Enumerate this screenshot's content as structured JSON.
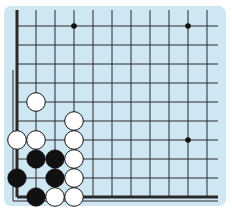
{
  "board": {
    "background": "#cfe6f3",
    "line_color": "#2a2a2a",
    "origin_x": 17,
    "origin_y": 197,
    "spacing": 19,
    "cols": 11,
    "rows": 10,
    "edges": [
      "left",
      "bottom"
    ],
    "star_points": [
      [
        3,
        9
      ],
      [
        9,
        9
      ],
      [
        9,
        3
      ]
    ],
    "stones": [
      {
        "color": "white",
        "col": 1,
        "row": 5
      },
      {
        "color": "white",
        "col": 3,
        "row": 4
      },
      {
        "color": "white",
        "col": 0,
        "row": 3
      },
      {
        "color": "white",
        "col": 1,
        "row": 3
      },
      {
        "color": "white",
        "col": 3,
        "row": 3
      },
      {
        "color": "black",
        "col": 1,
        "row": 2
      },
      {
        "color": "black",
        "col": 2,
        "row": 2
      },
      {
        "color": "white",
        "col": 3,
        "row": 2
      },
      {
        "color": "black",
        "col": 0,
        "row": 1
      },
      {
        "color": "black",
        "col": 2,
        "row": 1
      },
      {
        "color": "white",
        "col": 3,
        "row": 1
      },
      {
        "color": "black",
        "col": 1,
        "row": 0
      },
      {
        "color": "white",
        "col": 2,
        "row": 0
      },
      {
        "color": "white",
        "col": 3,
        "row": 0
      }
    ]
  }
}
